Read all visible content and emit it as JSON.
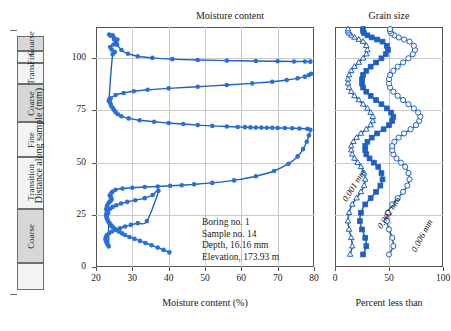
{
  "figure": {
    "panels": {
      "moisture_title": "Moisture content",
      "grain_title": "Grain size"
    },
    "y_axis": {
      "label": "Distance along sample (mm)",
      "ticks": [
        "0",
        "25",
        "50",
        "75",
        "100"
      ],
      "min": 0,
      "max": 115
    },
    "moisture_axis": {
      "label": "Moisture content (%)",
      "ticks": [
        "20",
        "30",
        "40",
        "50",
        "60",
        "70",
        "80"
      ],
      "min": 20,
      "max": 80
    },
    "grain_axis": {
      "label": "Percent less than",
      "ticks": [
        "0",
        "50",
        "100"
      ],
      "min": 0,
      "max": 100
    },
    "core_log": {
      "segments": [
        {
          "label": "",
          "shaded": false
        },
        {
          "label": "Coarse",
          "shaded": true
        },
        {
          "label": "Transition",
          "shaded": false
        },
        {
          "label": "Fine",
          "shaded": false
        },
        {
          "label": "Coarse",
          "shaded": true
        },
        {
          "label": "Trans.",
          "shaded": false
        },
        {
          "label": "Fine",
          "shaded": false
        },
        {
          "label": "Coarse",
          "shaded": true
        }
      ]
    },
    "annotation": {
      "lines": [
        "Boring no. 1",
        "Sample no. 14",
        "Depth, 16.16 mm",
        "Elevation, 173.93 m"
      ]
    },
    "curve_labels": {
      "d001": "0.001 mm",
      "d002": "0.002 mm",
      "d006": "0.006 mm"
    },
    "colors": {
      "data": "#1f5fc4",
      "marker_fill": "#2a6fd6",
      "grid": "#c9c9c9",
      "frame": "#555555",
      "core_shaded": "#d7d7d7"
    }
  },
  "chart_data": [
    {
      "type": "scatter",
      "title": "Moisture content",
      "xlabel": "Moisture content (%)",
      "ylabel": "Distance along sample (mm)",
      "xlim": [
        20,
        80
      ],
      "ylim": [
        0,
        115
      ],
      "grid": true,
      "series": [
        {
          "name": "Moisture content profile",
          "x": [
            40.2,
            38.6,
            37.0,
            35.3,
            33.6,
            32.1,
            30.6,
            29.2,
            28.0,
            27.2,
            26.4,
            25.8,
            25.2,
            24.7,
            24.3,
            24.0,
            23.7,
            23.4,
            23.2,
            23.0,
            22.9,
            22.8,
            22.9,
            23.1,
            23.4,
            23.9,
            24.6,
            25.6,
            26.9,
            28.6,
            30.8,
            33.4,
            35.6,
            37.2,
            34.0,
            31.5,
            29.6,
            28.0,
            26.6,
            25.4,
            24.4,
            23.6,
            23.0,
            22.7,
            22.6,
            22.8,
            23.1,
            23.5,
            23.3,
            23.0,
            22.8,
            23.0,
            23.4,
            23.7,
            24.0,
            24.3,
            24.1,
            23.8,
            24.2,
            24.6,
            25.4,
            27.3,
            30.0,
            33.4,
            37.0,
            40.4,
            43.6,
            47.0,
            52.0,
            58.0,
            64.0,
            69.0,
            73.0,
            75.5,
            77.0,
            78.0,
            78.6,
            79.0,
            78.2,
            76.0,
            74.0,
            72.0,
            70.0,
            68.5,
            67.0,
            65.5,
            64.0,
            62.5,
            61.0,
            59.0,
            56.0,
            52.0,
            48.0,
            44.0,
            40.0,
            36.0,
            32.0,
            29.0,
            27.0,
            26.0,
            25.4,
            25.0,
            24.6,
            24.2,
            24.0,
            23.8,
            23.6,
            24.6,
            25.2,
            24.3,
            23.9,
            24.8,
            25.6,
            25.9,
            24.9,
            24.0,
            23.6
          ],
          "y": [
            7.0,
            8.2,
            9.3,
            10.4,
            11.5,
            12.5,
            13.5,
            14.4,
            15.3,
            16.1,
            16.9,
            17.6,
            18.3,
            19.0,
            19.7,
            20.4,
            21.1,
            21.8,
            22.5,
            23.2,
            24.0,
            24.8,
            25.6,
            26.4,
            27.2,
            28.0,
            28.8,
            29.6,
            30.4,
            31.2,
            32.0,
            33.0,
            34.5,
            36.5,
            22.0,
            21.0,
            20.2,
            19.4,
            18.6,
            17.8,
            17.0,
            16.2,
            15.3,
            14.3,
            13.2,
            12.1,
            11.0,
            10.0,
            25.8,
            26.8,
            27.8,
            29.2,
            30.4,
            31.2,
            31.8,
            32.4,
            33.4,
            34.4,
            35.4,
            36.2,
            37.0,
            37.6,
            38.0,
            38.3,
            38.6,
            38.9,
            39.2,
            39.6,
            40.3,
            41.5,
            43.5,
            46.0,
            49.5,
            53.0,
            56.5,
            60.0,
            63.0,
            65.8,
            66.2,
            66.4,
            66.5,
            66.6,
            66.6,
            66.7,
            66.7,
            66.8,
            66.8,
            66.9,
            67.0,
            67.1,
            67.3,
            67.6,
            68.0,
            68.5,
            69.0,
            69.6,
            70.3,
            71.2,
            72.2,
            73.2,
            74.2,
            75.2,
            76.2,
            77.2,
            78.2,
            79.2,
            80.2,
            102.0,
            103.0,
            104.2,
            105.4,
            106.6,
            107.8,
            109.0,
            110.0,
            110.8,
            111.4
          ]
        },
        {
          "name": "Upper limb",
          "x": [
            23.5,
            24.0,
            25.4,
            27.6,
            30.4,
            34.2,
            40.0,
            48.0,
            56.0,
            63.0,
            68.5,
            72.5,
            75.5,
            77.5,
            78.6,
            79.2
          ],
          "y": [
            79.5,
            80.8,
            82.4,
            83.4,
            84.2,
            84.9,
            85.6,
            86.4,
            87.2,
            88.0,
            88.8,
            89.6,
            90.4,
            91.2,
            92.0,
            92.6
          ]
        },
        {
          "name": "Top segment",
          "x": [
            24.6,
            25.0,
            25.8,
            27.0,
            28.8,
            31.5,
            35.5,
            41.0,
            48.0,
            56.0,
            64.0,
            70.0,
            74.5,
            77.5,
            79.0
          ],
          "y": [
            111.0,
            109.0,
            106.5,
            104.0,
            102.2,
            101.0,
            100.2,
            99.6,
            99.2,
            98.9,
            98.7,
            98.6,
            98.5,
            98.5,
            98.4
          ]
        }
      ],
      "markers": "filled-circle",
      "marker_color": "#2a6fd6"
    },
    {
      "type": "line",
      "title": "Grain size",
      "xlabel": "Percent less than",
      "ylabel": "Distance along sample (mm)",
      "xlim": [
        0,
        100
      ],
      "ylim": [
        0,
        115
      ],
      "grid": true,
      "series": [
        {
          "name": "0.001 mm",
          "marker": "open-triangle",
          "x": [
            14,
            16,
            15,
            13,
            12,
            13,
            16,
            20,
            24,
            27,
            28,
            27,
            24,
            21,
            18,
            16,
            15,
            15,
            17,
            20,
            24,
            29,
            33,
            35,
            35,
            33,
            30,
            26,
            22,
            18,
            15,
            13,
            12,
            12,
            13,
            15,
            18,
            22,
            26,
            29,
            30,
            29,
            26,
            22,
            18,
            15,
            13,
            12,
            12
          ],
          "y": [
            6,
            10,
            14,
            18,
            22,
            26,
            30,
            33,
            36,
            39,
            42,
            45,
            48,
            50,
            52,
            54,
            56,
            58,
            60,
            62,
            64,
            66,
            68,
            70,
            72,
            74,
            76,
            78,
            80,
            82,
            84,
            86,
            88,
            90,
            92,
            94,
            96,
            98,
            100,
            102,
            104,
            106,
            108,
            109,
            110,
            111,
            112,
            113,
            114
          ]
        },
        {
          "name": "0.002 mm",
          "marker": "filled-square",
          "x": [
            26,
            29,
            28,
            25,
            23,
            24,
            28,
            33,
            38,
            42,
            44,
            43,
            40,
            36,
            32,
            29,
            28,
            28,
            30,
            34,
            39,
            45,
            50,
            53,
            54,
            52,
            48,
            43,
            38,
            33,
            29,
            26,
            25,
            25,
            26,
            29,
            33,
            38,
            43,
            47,
            49,
            48,
            44,
            39,
            34,
            30,
            27,
            26,
            26
          ],
          "y": [
            6,
            10,
            14,
            18,
            22,
            26,
            30,
            33,
            36,
            39,
            42,
            45,
            48,
            50,
            52,
            54,
            56,
            58,
            60,
            62,
            64,
            66,
            68,
            70,
            72,
            74,
            76,
            78,
            80,
            82,
            84,
            86,
            88,
            90,
            92,
            94,
            96,
            98,
            100,
            102,
            104,
            106,
            108,
            109,
            110,
            111,
            112,
            113,
            114
          ]
        },
        {
          "name": "0.006 mm",
          "marker": "open-circle",
          "x": [
            50,
            54,
            53,
            50,
            48,
            49,
            53,
            58,
            63,
            67,
            69,
            68,
            65,
            61,
            57,
            54,
            53,
            53,
            55,
            59,
            64,
            70,
            75,
            78,
            79,
            77,
            73,
            68,
            63,
            58,
            54,
            51,
            50,
            50,
            51,
            54,
            58,
            63,
            68,
            72,
            74,
            73,
            69,
            64,
            59,
            55,
            52,
            51,
            51
          ],
          "y": [
            6,
            10,
            14,
            18,
            22,
            26,
            30,
            33,
            36,
            39,
            42,
            45,
            48,
            50,
            52,
            54,
            56,
            58,
            60,
            62,
            64,
            66,
            68,
            70,
            72,
            74,
            76,
            78,
            80,
            82,
            84,
            86,
            88,
            90,
            92,
            94,
            96,
            98,
            100,
            102,
            104,
            106,
            108,
            109,
            110,
            111,
            112,
            113,
            114
          ]
        }
      ]
    }
  ]
}
